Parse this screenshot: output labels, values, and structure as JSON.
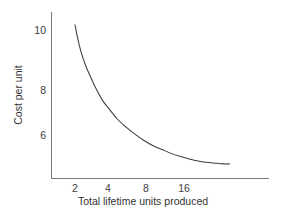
{
  "chart_data": {
    "type": "line",
    "title": "",
    "subtitle": "",
    "xlabel": "Total lifetime units produced",
    "ylabel": "Cost per unit",
    "xscale": "log2",
    "yscale": "linear",
    "grid": false,
    "legend": null,
    "annotations": [],
    "xtick_labels": [
      "2",
      "4",
      "8",
      "16"
    ],
    "xtick_values": [
      2,
      4,
      8,
      16
    ],
    "ytick_labels": [
      "10",
      "8",
      "6"
    ],
    "ytick_values": [
      10,
      8,
      6
    ],
    "xlim": [
      1.75,
      42
    ],
    "ylim": [
      4.3,
      11.1
    ],
    "series": [
      {
        "name": "Unit cost experience curve",
        "color": "#3c3c3c",
        "x": [
          2.0,
          2.1,
          2.25,
          2.45,
          2.7,
          3.0,
          3.4,
          3.9,
          4.5,
          5.3,
          6.2,
          7.4,
          8.8,
          10.5,
          12.5,
          15.0,
          18.0,
          21.5,
          25.5,
          30.0,
          34.0,
          38.0
        ],
        "y": [
          10.2,
          9.7,
          9.15,
          8.65,
          8.2,
          7.75,
          7.3,
          6.95,
          6.6,
          6.3,
          6.05,
          5.8,
          5.6,
          5.45,
          5.3,
          5.18,
          5.08,
          5.0,
          4.95,
          4.92,
          4.9,
          4.9
        ]
      }
    ]
  },
  "axes": {
    "y_title": "Cost per unit",
    "x_title": "Total lifetime units produced",
    "y_ticks": [
      {
        "label": "10",
        "y_px": 30
      },
      {
        "label": "8",
        "y_px": 90
      },
      {
        "label": "6",
        "y_px": 135
      }
    ],
    "x_ticks": [
      {
        "label": "2",
        "x_px": 75
      },
      {
        "label": "4",
        "x_px": 108
      },
      {
        "label": "8",
        "x_px": 146
      },
      {
        "label": "16",
        "x_px": 184
      }
    ]
  },
  "style": {
    "axis_color": "#7a7a7a",
    "curve_color": "#3c3c3c",
    "text_color": "#333333",
    "background": "#ffffff"
  }
}
